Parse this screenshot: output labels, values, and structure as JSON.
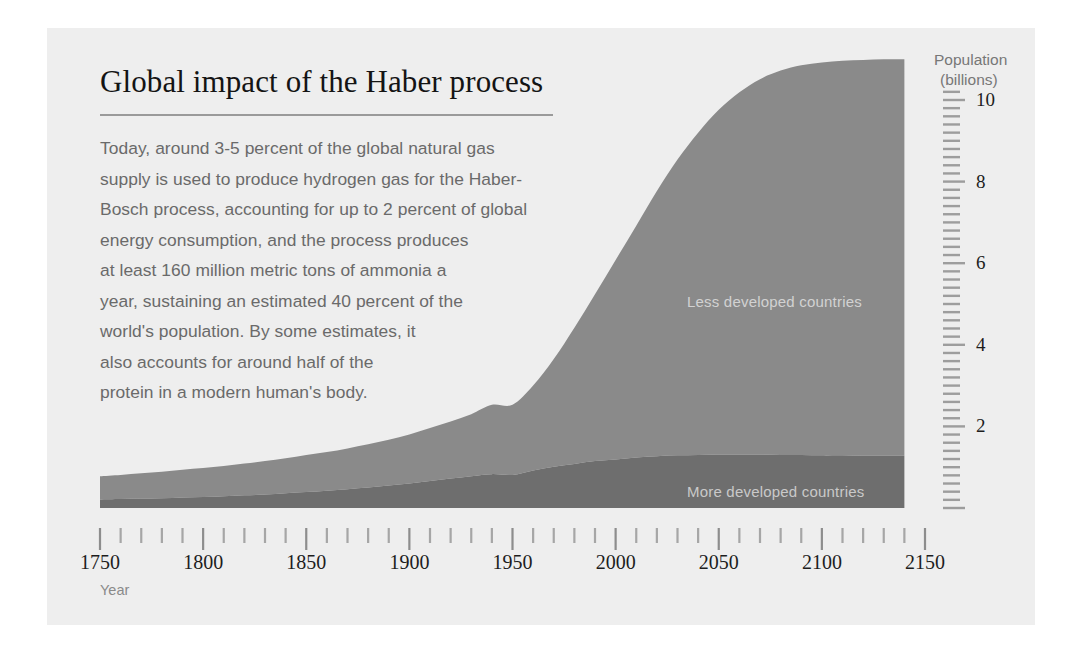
{
  "figure": {
    "title": "Global impact of the Haber process",
    "background_color": "#eeeeee",
    "page_color": "#ffffff"
  },
  "body_text": {
    "lines": [
      "Today, around 3-5 percent of the global natural gas",
      "supply is used to produce hydrogen gas for the Haber-",
      "Bosch process, accounting for up to 2 percent of global",
      "energy consumption, and the process produces",
      "at least 160 million metric tons of ammonia a",
      "year, sustaining an estimated 40 percent of the",
      "world's population. By some estimates, it",
      "also accounts for around half of the",
      "protein in a modern human's body."
    ]
  },
  "axes": {
    "y_title_line1": "Population",
    "y_title_line2": "(billions)",
    "x_title": "Year",
    "y_tick_labels": [
      "10",
      "8",
      "6",
      "4",
      "2"
    ],
    "x_tick_labels": [
      "1750",
      "1800",
      "1850",
      "1900",
      "1950",
      "2000",
      "2050",
      "2100",
      "2150"
    ]
  },
  "chart_data": {
    "type": "area",
    "title": "Global impact of the Haber process",
    "xlabel": "Year",
    "ylabel": "Population (billions)",
    "xlim": [
      1750,
      2150
    ],
    "ylim": [
      0,
      11
    ],
    "grid": false,
    "stacked": true,
    "legend_position": "in-plot",
    "y_ticks_major": [
      2,
      4,
      6,
      8,
      10
    ],
    "y_tick_interval_minor": 0.2,
    "x_ticks_major": [
      1750,
      1800,
      1850,
      1900,
      1950,
      2000,
      2050,
      2100,
      2150
    ],
    "x_tick_interval_minor": 10,
    "x": [
      1750,
      1760,
      1770,
      1780,
      1790,
      1800,
      1810,
      1820,
      1830,
      1840,
      1850,
      1860,
      1870,
      1880,
      1890,
      1900,
      1910,
      1920,
      1930,
      1940,
      1950,
      1960,
      1970,
      1980,
      1990,
      2000,
      2010,
      2020,
      2030,
      2040,
      2050,
      2060,
      2070,
      2080,
      2090,
      2100,
      2110,
      2120,
      2130,
      2140
    ],
    "series": [
      {
        "name": "More developed countries",
        "color": "#6e6e6e",
        "values": [
          0.21,
          0.22,
          0.23,
          0.24,
          0.26,
          0.27,
          0.29,
          0.31,
          0.33,
          0.36,
          0.39,
          0.42,
          0.46,
          0.5,
          0.55,
          0.6,
          0.66,
          0.72,
          0.78,
          0.83,
          0.81,
          0.92,
          1.01,
          1.08,
          1.15,
          1.19,
          1.24,
          1.27,
          1.29,
          1.3,
          1.31,
          1.31,
          1.31,
          1.3,
          1.3,
          1.29,
          1.29,
          1.28,
          1.28,
          1.28
        ]
      },
      {
        "name": "Less developed countries",
        "color": "#8a8a8a",
        "values": [
          0.57,
          0.59,
          0.62,
          0.65,
          0.68,
          0.71,
          0.74,
          0.78,
          0.82,
          0.86,
          0.91,
          0.95,
          1.0,
          1.06,
          1.12,
          1.2,
          1.3,
          1.4,
          1.52,
          1.7,
          1.72,
          2.08,
          2.64,
          3.34,
          4.09,
          4.89,
          5.68,
          6.5,
          7.25,
          7.9,
          8.45,
          8.88,
          9.2,
          9.42,
          9.55,
          9.63,
          9.67,
          9.7,
          9.72,
          9.72
        ]
      }
    ],
    "totals": [
      0.78,
      0.81,
      0.85,
      0.89,
      0.94,
      0.98,
      1.03,
      1.09,
      1.15,
      1.22,
      1.3,
      1.37,
      1.46,
      1.56,
      1.67,
      1.8,
      1.96,
      2.12,
      2.3,
      2.53,
      2.53,
      3.0,
      3.65,
      4.42,
      5.24,
      6.08,
      6.92,
      7.77,
      8.54,
      9.2,
      9.76,
      10.19,
      10.51,
      10.72,
      10.85,
      10.92,
      10.96,
      10.98,
      11.0,
      11.0
    ]
  },
  "colors": {
    "panel": "#eeeeee",
    "less_developed": "#8a8a8a",
    "more_developed": "#6e6e6e",
    "title_text": "#141414",
    "body_text": "#6a6a6a",
    "tick_text": "#1d1d1d",
    "tick_mark": "#9d9d9d",
    "rule": "#9a9a9a"
  }
}
